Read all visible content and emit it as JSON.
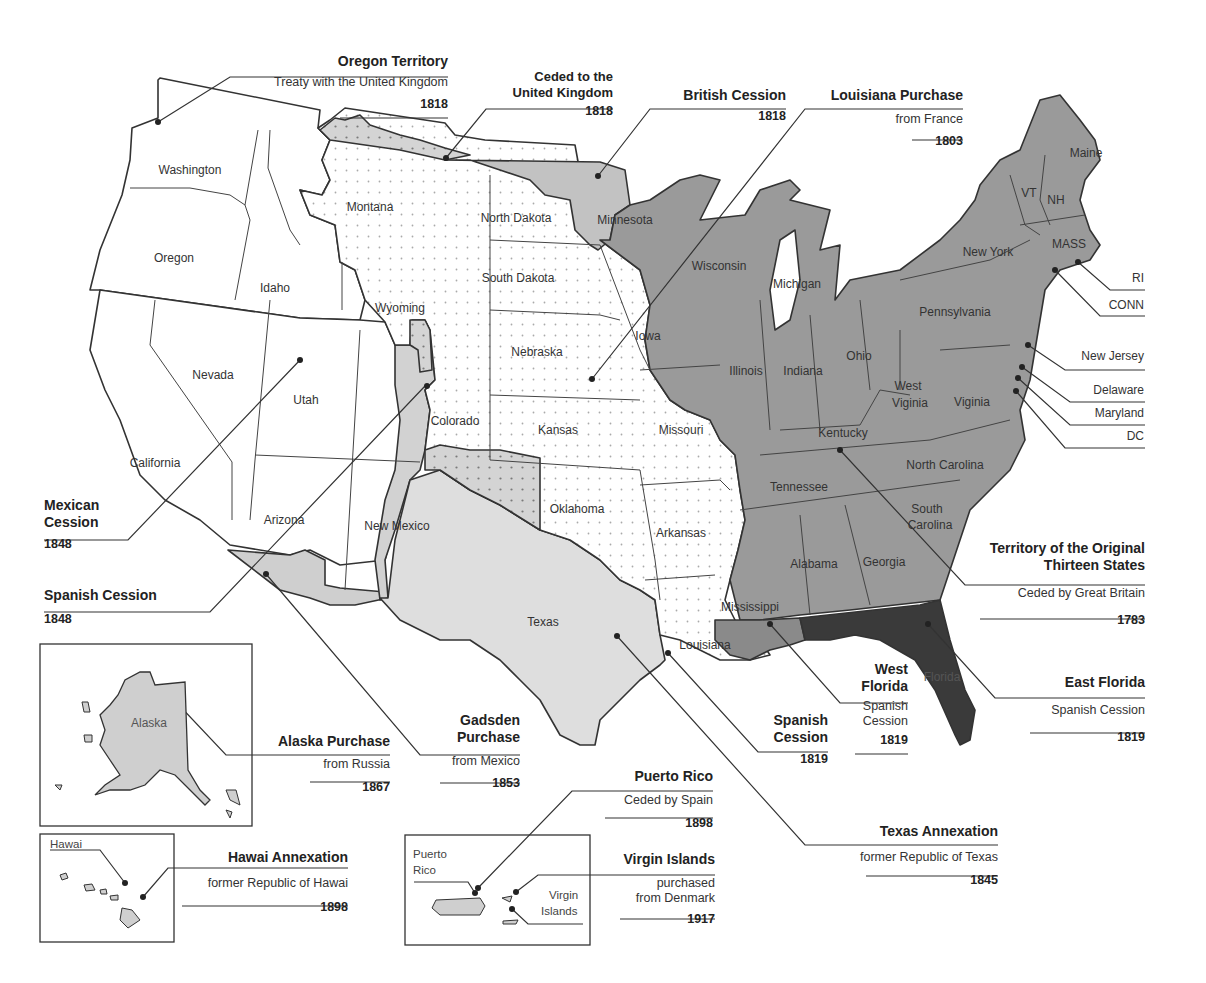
{
  "colors": {
    "original_13": "#9a9a9a",
    "louisiana_purchase": "#ffffff",
    "louisiana_dots": "#b0b0b0",
    "british_cession": "#c2c2c2",
    "texas_annex": "#dedede",
    "mexican_cession": "#ffffff",
    "spanish_cession_1848": "#d2d2d2",
    "gadsden": "#cfcfcf",
    "east_florida": "#3a3a3a",
    "west_florida": "#8a8a8a",
    "border": "#333333"
  },
  "states": {
    "washington": "Washington",
    "oregon": "Oregon",
    "idaho": "Idaho",
    "montana": "Montana",
    "wyoming": "Wyoming",
    "nevada": "Nevada",
    "utah": "Utah",
    "california": "California",
    "arizona": "Arizona",
    "new_mexico": "New Mexico",
    "colorado": "Colorado",
    "north_dakota": "North Dakota",
    "south_dakota": "South Dakota",
    "nebraska": "Nebraska",
    "kansas": "Kansas",
    "oklahoma": "Oklahoma",
    "texas": "Texas",
    "minnesota": "Minnesota",
    "iowa": "Iowa",
    "missouri": "Missouri",
    "arkansas": "Arkansas",
    "louisiana": "Louisiana",
    "wisconsin": "Wisconsin",
    "michigan": "Michigan",
    "illinois": "Illinois",
    "indiana": "Indiana",
    "ohio": "Ohio",
    "kentucky": "Kentucky",
    "tennessee": "Tennessee",
    "mississippi": "Mississippi",
    "alabama": "Alabama",
    "georgia": "Georgia",
    "florida": "Florida",
    "south_carolina_1": "South",
    "south_carolina_2": "Carolina",
    "north_carolina": "North Carolina",
    "virginia": "Viginia",
    "west_virginia_1": "West",
    "west_virginia_2": "Viginia",
    "pennsylvania": "Pennsylvania",
    "new_york": "New York",
    "vermont": "VT",
    "new_hampshire": "NH",
    "maine": "Maine",
    "massachusetts": "MASS",
    "alaska": "Alaska",
    "hawaii": "Hawai",
    "puerto_rico_1": "Puerto",
    "puerto_rico_2": "Rico",
    "virgin_islands_1": "Virgin",
    "virgin_islands_2": "Islands"
  },
  "northeast_labels": {
    "ri": "RI",
    "conn": "CONN",
    "new_jersey": "New Jersey",
    "delaware": "Delaware",
    "maryland": "Maryland",
    "dc": "DC"
  },
  "callouts": {
    "oregon_territory": {
      "title": "Oregon Territory",
      "subtitle": "Treaty with the United Kingdom",
      "year": "1818"
    },
    "ceded_uk": {
      "title1": "Ceded to the",
      "title2": "United Kingdom",
      "year": "1818"
    },
    "british_cession": {
      "title": "British Cession",
      "year": "1818"
    },
    "louisiana_purchase": {
      "title": "Louisiana Purchase",
      "subtitle": "from France",
      "year": "1803"
    },
    "original_thirteen": {
      "title1": "Territory of the Original",
      "title2": "Thirteen States",
      "subtitle": "Ceded by Great Britain",
      "year": "1783"
    },
    "east_florida": {
      "title": "East Florida",
      "subtitle": "Spanish Cession",
      "year": "1819"
    },
    "west_florida": {
      "title1": "West",
      "title2": "Florida",
      "subtitle1": "Spanish",
      "subtitle2": "Cession",
      "year": "1819"
    },
    "spanish_cession_1819": {
      "title1": "Spanish",
      "title2": "Cession",
      "year": "1819"
    },
    "texas_annexation": {
      "title": "Texas Annexation",
      "subtitle": "former Republic of Texas",
      "year": "1845"
    },
    "mexican_cession": {
      "title1": "Mexican",
      "title2": "Cession",
      "year": "1848"
    },
    "spanish_cession_1848": {
      "title": "Spanish Cession",
      "year": "1848"
    },
    "gadsden_purchase": {
      "title1": "Gadsden",
      "title2": "Purchase",
      "subtitle": "from Mexico",
      "year": "1853"
    },
    "alaska_purchase": {
      "title": "Alaska Purchase",
      "subtitle": "from Russia",
      "year": "1867"
    },
    "hawaii_annexation": {
      "title": "Hawai Annexation",
      "subtitle": "former Republic of Hawai",
      "year": "1898"
    },
    "puerto_rico": {
      "title": "Puerto Rico",
      "subtitle": "Ceded by Spain",
      "year": "1898"
    },
    "virgin_islands": {
      "title": "Virgin Islands",
      "subtitle1": "purchased",
      "subtitle2": "from Denmark",
      "year": "1917"
    }
  }
}
